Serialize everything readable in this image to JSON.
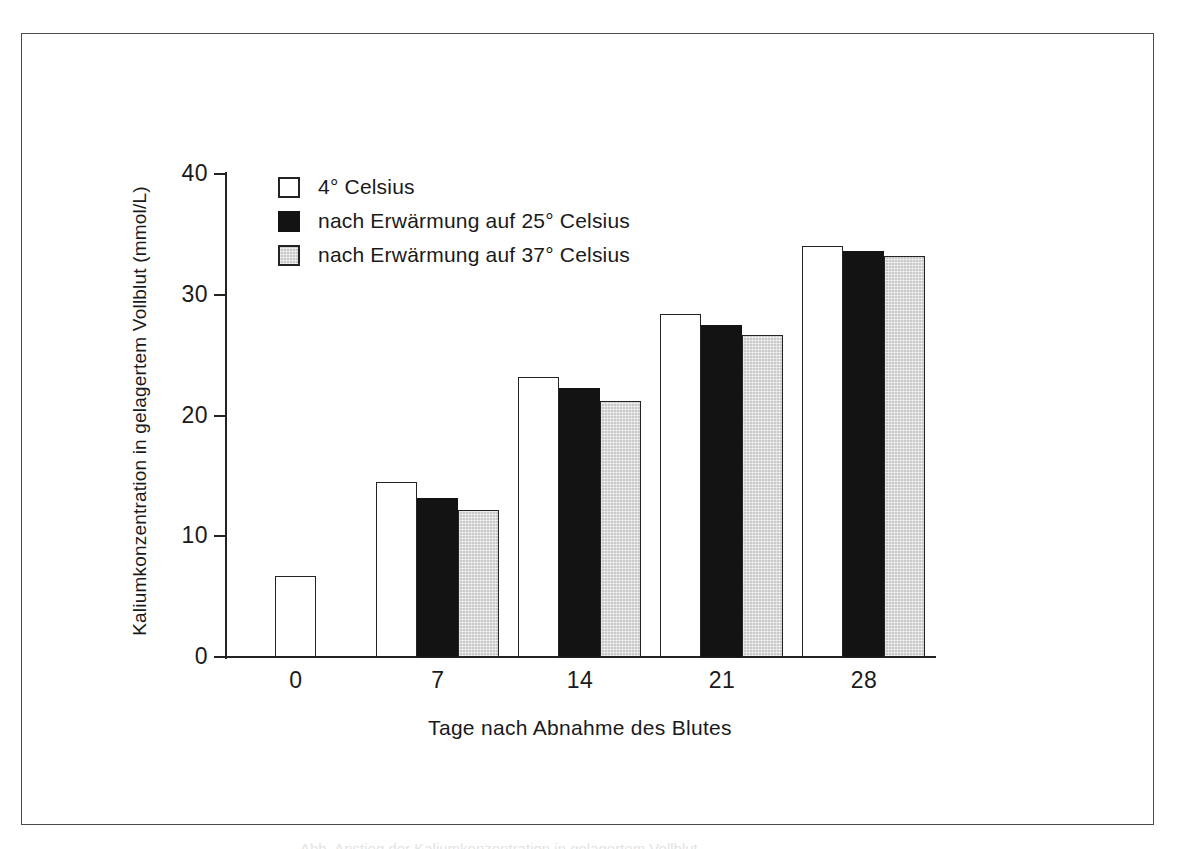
{
  "figure": {
    "frame": "scanned-figure-border",
    "caption_remnant": "Abb. Anstieg der Kaliumkonzentration in gelagertem Vollblut"
  },
  "chart_data": {
    "type": "bar",
    "title": "",
    "subtitle": "",
    "xlabel": "Tage nach Abnahme des Blutes",
    "ylabel": "Kaliumkonzentration in gelagertem Vollblut (mmol/L)",
    "categories": [
      "0",
      "7",
      "14",
      "21",
      "28"
    ],
    "ylim": [
      0,
      40
    ],
    "yticks": [
      "0",
      "10",
      "20",
      "30",
      "40"
    ],
    "ytick_values": [
      0,
      10,
      20,
      30,
      40
    ],
    "grid": false,
    "legend_position": "upper-left-inside",
    "series": [
      {
        "name": "4° Celsius",
        "color": "#ffffff",
        "values": [
          6.7,
          14.5,
          23.2,
          28.4,
          34.0
        ]
      },
      {
        "name": "nach Erwärmung auf 25° Celsius",
        "color": "#131313",
        "values": [
          null,
          13.2,
          22.3,
          27.5,
          33.6
        ]
      },
      {
        "name": "nach Erwärmung auf 37° Celsius",
        "color": "#c9c9c9",
        "values": [
          null,
          12.2,
          21.2,
          26.7,
          33.2
        ]
      }
    ]
  }
}
